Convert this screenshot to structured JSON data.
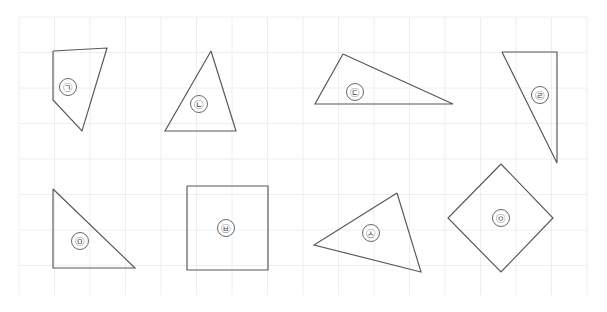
{
  "canvas": {
    "width": 607,
    "height": 312,
    "background_color": "#ffffff",
    "stroke_color": "#55565c",
    "grid_color": "#eceef2",
    "grid_spacing": 35.5,
    "grid_origin_x": 19,
    "grid_origin_y": 17,
    "grid_region": {
      "x": 19,
      "y": 17,
      "width": 568,
      "height": 278
    }
  },
  "shapes": [
    {
      "id": "shape-1",
      "label": "㉠",
      "label_name": "circled-giyeok",
      "type": "pentagon",
      "points": "53,51 107,48 82,131 53,100 53,51",
      "label_x": 68,
      "label_y": 87,
      "label_r": 8.5
    },
    {
      "id": "shape-2",
      "label": "㉡",
      "label_name": "circled-nieun",
      "type": "triangle",
      "points": "211,51 236,131 165,131 211,51",
      "label_x": 199,
      "label_y": 104,
      "label_r": 8.5
    },
    {
      "id": "shape-3",
      "label": "㉢",
      "label_name": "circled-digeut",
      "type": "triangle",
      "points": "343,54 453,104 315,104 343,54",
      "label_x": 355,
      "label_y": 92,
      "label_r": 8.5
    },
    {
      "id": "shape-4",
      "label": "㉣",
      "label_name": "circled-rieul",
      "type": "triangle",
      "points": "502,52 557,52 557,163 502,52",
      "label_x": 540,
      "label_y": 95,
      "label_r": 8.5
    },
    {
      "id": "shape-5",
      "label": "㉤",
      "label_name": "circled-mieum",
      "type": "right-triangle",
      "points": "53,189 135,268 53,268 53,189",
      "label_x": 80,
      "label_y": 241,
      "label_r": 8.5
    },
    {
      "id": "shape-6",
      "label": "㉥",
      "label_name": "circled-bieup",
      "type": "square",
      "points": "187,186 268,186 268,270 187,270 187,186",
      "label_x": 226,
      "label_y": 228,
      "label_r": 8.5
    },
    {
      "id": "shape-7",
      "label": "㉦",
      "label_name": "circled-siot",
      "type": "triangle",
      "points": "397,193 421,272 314,245 397,193",
      "label_x": 371,
      "label_y": 233,
      "label_r": 8.5
    },
    {
      "id": "shape-8",
      "label": "㉧",
      "label_name": "circled-ieung",
      "type": "rhombus",
      "points": "501,164 553,218 501,272 448,218 501,164",
      "label_x": 501,
      "label_y": 218,
      "label_r": 8.5
    }
  ]
}
